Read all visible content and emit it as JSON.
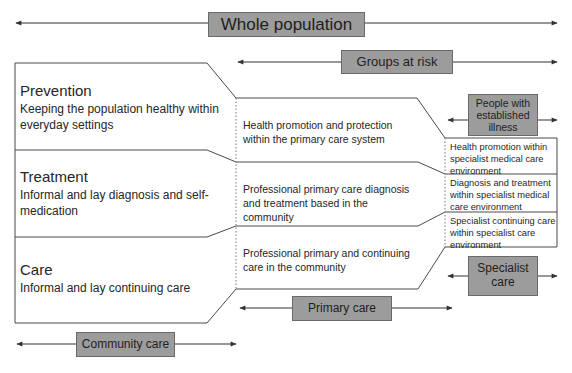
{
  "diagram": {
    "population_bands": {
      "whole_population": "Whole population",
      "groups_at_risk": "Groups at risk",
      "established_illness": "People with established illness"
    },
    "care_settings": {
      "community_care": "Community care",
      "primary_care": "Primary care",
      "specialist_care": "Specialist care"
    },
    "rows": [
      {
        "title": "Prevention",
        "community": "Keeping the population healthy within everyday settings",
        "primary": "Health promotion and protection within the primary care system",
        "specialist": "Health promotion within specialist medical care environment"
      },
      {
        "title": "Treatment",
        "community": "Informal and lay diagnosis and self-medication",
        "primary": "Professional primary care diagnosis and treatment based in the community",
        "specialist": "Diagnosis and treatment within specialist medical care environment"
      },
      {
        "title": "Care",
        "community": "Informal and lay continuing care",
        "primary": "Professional primary and continuing care in the community",
        "specialist": "Specialist continuing care within specialist care environment"
      }
    ],
    "colors": {
      "label_box_fill": "#9c9c9c",
      "line": "#333333",
      "background": "#ffffff"
    }
  }
}
